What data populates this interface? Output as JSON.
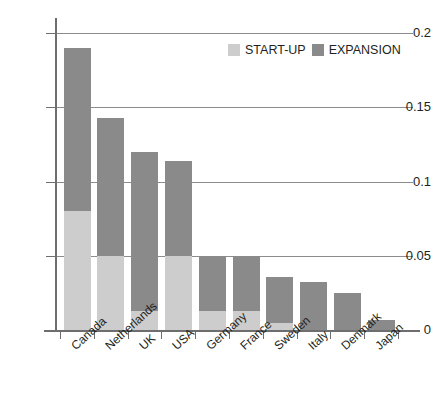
{
  "chart_data": {
    "type": "bar",
    "title": "",
    "xlabel": "",
    "ylabel": "",
    "ylim": [
      0,
      0.2
    ],
    "yticks": [
      "0",
      "0.05",
      "0.1",
      "0.15",
      "0.2"
    ],
    "ytick_values": [
      0,
      0.05,
      0.1,
      0.15,
      0.2
    ],
    "grid": true,
    "stacked": true,
    "legend_position": "top-right",
    "categories": [
      "Canada",
      "Netherlands",
      "UK",
      "USA",
      "Germany",
      "France",
      "Sweden",
      "Italy",
      "Denmark",
      "Japan"
    ],
    "series": [
      {
        "name": "START-UP",
        "color": "#cdcdcd",
        "values": [
          0.08,
          0.05,
          0.013,
          0.05,
          0.013,
          0.013,
          0.005,
          0.0,
          0.0,
          0.0
        ]
      },
      {
        "name": "EXPANSION",
        "color": "#8a8a8a",
        "values": [
          0.11,
          0.093,
          0.107,
          0.064,
          0.037,
          0.037,
          0.031,
          0.032,
          0.025,
          0.007
        ]
      }
    ],
    "totals": [
      0.19,
      0.143,
      0.12,
      0.114,
      0.05,
      0.05,
      0.036,
      0.032,
      0.025,
      0.007
    ]
  },
  "legend": {
    "items": [
      {
        "label": "START-UP",
        "color": "#cdcdcd"
      },
      {
        "label": "EXPANSION",
        "color": "#8a8a8a"
      }
    ]
  },
  "colors": {
    "start_up": "#cdcdcd",
    "expansion": "#8a8a8a",
    "axis": "#6e6e6e",
    "gridline": "#8c8c8c",
    "text": "#231f20",
    "background": "#ffffff"
  }
}
